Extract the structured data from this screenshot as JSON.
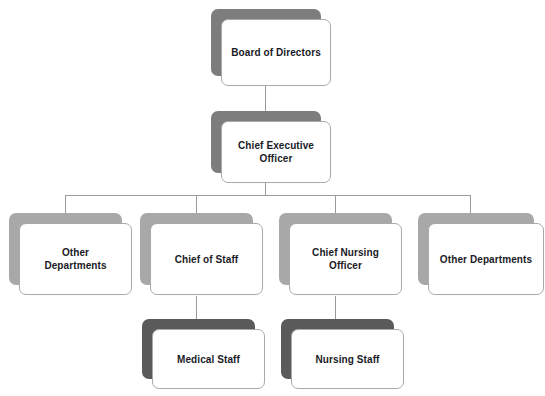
{
  "diagram": {
    "background_color": "#ffffff",
    "line_color": "#9a9a9a",
    "card_border_color": "#a9a9a9",
    "card_fill_color": "#ffffff",
    "text_color": "#1a1a26",
    "shadow_colors": {
      "light": "#a8a8a8",
      "dark": "#7d7d7d",
      "darker": "#5a5a5a"
    },
    "nodes": [
      {
        "id": "board",
        "label": "Board of Directors",
        "level": 1
      },
      {
        "id": "ceo",
        "label": "Chief Executive\nOfficer",
        "level": 2
      },
      {
        "id": "other_depts_left",
        "label": "Other\nDepartments",
        "level": 3
      },
      {
        "id": "chief_of_staff",
        "label": "Chief of Staff",
        "level": 3
      },
      {
        "id": "cno",
        "label": "Chief Nursing Officer",
        "level": 3
      },
      {
        "id": "other_depts_right",
        "label": "Other Departments",
        "level": 3
      },
      {
        "id": "medical_staff",
        "label": "Medical Staff",
        "level": 4
      },
      {
        "id": "nursing_staff",
        "label": "Nursing Staff",
        "level": 4
      }
    ]
  }
}
